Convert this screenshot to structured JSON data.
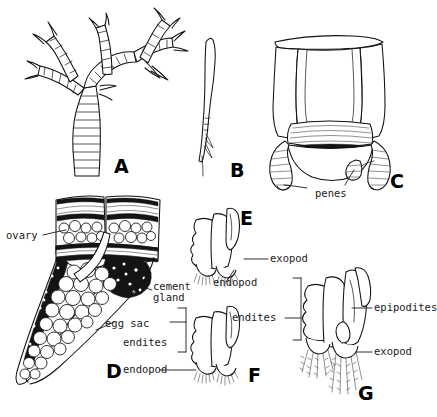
{
  "figure": {
    "kind": "scientific-illustration-plate",
    "background_color": "#ffffff",
    "ink_color": "#111111",
    "panel_count": 7
  },
  "panels": [
    {
      "letter": "A",
      "name": "branched-appendage",
      "caption": ""
    },
    {
      "letter": "B",
      "name": "slender-appendage",
      "caption": ""
    },
    {
      "letter": "C",
      "name": "genital-segment-with-penes",
      "caption": ""
    },
    {
      "letter": "D",
      "name": "female-reproductive-section",
      "caption": ""
    },
    {
      "letter": "E",
      "name": "limb-e",
      "caption": ""
    },
    {
      "letter": "F",
      "name": "limb-f",
      "caption": ""
    },
    {
      "letter": "G",
      "name": "limb-g",
      "caption": ""
    }
  ],
  "labels": {
    "penes": "penes",
    "ovary": "ovary",
    "cement_gland_line1": "cement",
    "cement_gland_line2": "gland",
    "egg_sac": "egg sac",
    "endites_f": "endites",
    "endopod_f": "endopod",
    "exopod_e": "exopod",
    "endopod_e": "endopod",
    "endites_g": "endites",
    "epipodites_g": "epipodites",
    "exopod_g": "exopod"
  }
}
